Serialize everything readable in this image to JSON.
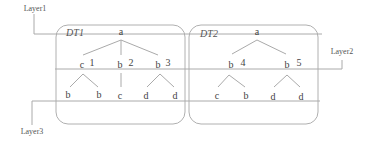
{
  "layers": {
    "layer1": {
      "label": "Layer1",
      "x": 35,
      "y": 8
    },
    "layer2": {
      "label": "Layer2",
      "x": 343,
      "y": 55
    },
    "layer3": {
      "label": "Layer3",
      "x": 31,
      "y": 132
    }
  },
  "trees": [
    {
      "id": "DT1",
      "label": "DT1",
      "root": "a",
      "children": [
        {
          "label": "c",
          "number": "1",
          "children": [
            "b",
            "b"
          ]
        },
        {
          "label": "b",
          "number": "2",
          "children": [
            "c"
          ]
        },
        {
          "label": "b",
          "number": "3",
          "children": [
            "d",
            "d"
          ]
        }
      ]
    },
    {
      "id": "DT2",
      "label": "DT2",
      "root": "a",
      "children": [
        {
          "label": "b",
          "number": "4",
          "children": [
            "c",
            "b"
          ]
        },
        {
          "label": "b",
          "number": "5",
          "children": [
            "d",
            "d"
          ]
        }
      ]
    }
  ],
  "colors": {
    "line": "#aaaaaa",
    "box": "#b0b0b0",
    "text": "#444444"
  }
}
